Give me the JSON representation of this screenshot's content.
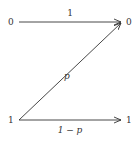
{
  "diagram": {
    "inputs": [
      {
        "label": "0"
      },
      {
        "label": "1"
      }
    ],
    "outputs": [
      {
        "label": "0"
      },
      {
        "label": "1"
      }
    ],
    "edges": [
      {
        "from": "0",
        "to": "0",
        "label": "1"
      },
      {
        "from": "1",
        "to": "0",
        "label": "p"
      },
      {
        "from": "1",
        "to": "1",
        "label": "1 − p"
      }
    ],
    "colors": {
      "line": "#333333",
      "text": "#333333"
    }
  }
}
